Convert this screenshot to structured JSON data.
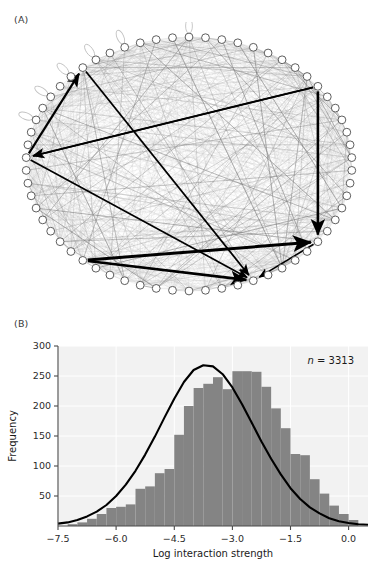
{
  "figure": {
    "panels": [
      {
        "id": "A",
        "label": "(A)",
        "type": "network-diagram"
      },
      {
        "id": "B",
        "label": "(B)",
        "type": "histogram"
      }
    ]
  },
  "panel_a": {
    "label": "(A)",
    "description": "Circular food-web interaction network",
    "node_count": 62,
    "node_fill": "#ffffff",
    "node_stroke": "#555555",
    "weak_link_color": "#b9b9b9",
    "strong_link_color": "#000000",
    "self_loop_count": 6,
    "strong_arrows": [
      {
        "from": 9,
        "to": 22,
        "width": 2.6
      },
      {
        "from": 9,
        "to": 47,
        "width": 1.9
      },
      {
        "from": 22,
        "to": 27,
        "width": 1.6
      },
      {
        "from": 38,
        "to": 22,
        "width": 3.0
      },
      {
        "from": 38,
        "to": 27,
        "width": 2.6
      },
      {
        "from": 47,
        "to": 55,
        "width": 2.2
      },
      {
        "from": 47,
        "to": 27,
        "width": 1.7
      },
      {
        "from": 55,
        "to": 27,
        "width": 1.8
      },
      {
        "from": 9,
        "to": 47,
        "width": 1.5
      }
    ]
  },
  "panel_b": {
    "label": "(B)",
    "annotation_n_italic": "n",
    "annotation_n_rest": " = 3313",
    "annotation_full": "n = 3313",
    "bar_color": "#848484",
    "curve_color": "#000000",
    "plot_bg": "#f2f2f2",
    "grid_color": "#ffffff"
  },
  "chart_data": {
    "type": "bar",
    "title": "",
    "subtitle": "",
    "xlabel": "Log interaction strength",
    "ylabel": "Frequency",
    "xlim": [
      -7.5,
      0.5
    ],
    "ylim": [
      0,
      300
    ],
    "xticks": [
      -7.5,
      -6.0,
      -4.5,
      -3.0,
      -1.5,
      0.0
    ],
    "xtick_labels": [
      "−7.5",
      "−6.0",
      "−4.5",
      "−3.0",
      "−1.5",
      "0.0"
    ],
    "yticks": [
      50,
      100,
      150,
      200,
      250,
      300
    ],
    "ytick_labels": [
      "50",
      "100",
      "150",
      "200",
      "250",
      "300"
    ],
    "grid": true,
    "legend": null,
    "n": 3313,
    "annotations": [
      {
        "text": "n = 3313",
        "x": -1.4,
        "y": 278,
        "italic_prefix": "n"
      }
    ],
    "bin_width": 0.25,
    "bin_edges": [
      -7.25,
      -7.0,
      -6.75,
      -6.5,
      -6.25,
      -6.0,
      -5.75,
      -5.5,
      -5.25,
      -5.0,
      -4.75,
      -4.5,
      -4.25,
      -4.0,
      -3.75,
      -3.5,
      -3.25,
      -3.0,
      -2.75,
      -2.5,
      -2.25,
      -2.0,
      -1.75,
      -1.5,
      -1.25,
      -1.0,
      -0.75,
      -0.5,
      -0.25,
      0.0,
      0.25
    ],
    "bin_centers": [
      -7.125,
      -6.875,
      -6.625,
      -6.375,
      -6.125,
      -5.875,
      -5.625,
      -5.375,
      -5.125,
      -4.875,
      -4.625,
      -4.375,
      -4.125,
      -3.875,
      -3.625,
      -3.375,
      -3.125,
      -2.875,
      -2.625,
      -2.375,
      -2.125,
      -1.875,
      -1.625,
      -1.375,
      -1.125,
      -0.875,
      -0.625,
      -0.375,
      -0.125,
      0.125
    ],
    "categories": [
      "-7.13",
      "-6.88",
      "-6.63",
      "-6.38",
      "-6.13",
      "-5.88",
      "-5.63",
      "-5.38",
      "-5.13",
      "-4.88",
      "-4.63",
      "-4.38",
      "-4.13",
      "-3.88",
      "-3.63",
      "-3.38",
      "-3.13",
      "-2.88",
      "-2.63",
      "-2.38",
      "-2.13",
      "-1.88",
      "-1.63",
      "-1.38",
      "-1.13",
      "-0.88",
      "-0.63",
      "-0.38",
      "-0.13",
      "0.13"
    ],
    "values": [
      3,
      6,
      12,
      20,
      30,
      32,
      36,
      62,
      66,
      88,
      95,
      152,
      200,
      230,
      237,
      248,
      228,
      258,
      258,
      257,
      232,
      196,
      163,
      120,
      118,
      78,
      54,
      34,
      20,
      10
    ],
    "series": [
      {
        "name": "Frequency",
        "type": "bar",
        "color": "#848484",
        "values": [
          3,
          6,
          12,
          20,
          30,
          32,
          36,
          62,
          66,
          88,
          95,
          152,
          200,
          230,
          237,
          248,
          228,
          258,
          258,
          257,
          232,
          196,
          163,
          120,
          118,
          78,
          54,
          34,
          20,
          10
        ]
      },
      {
        "name": "Fitted normal curve",
        "type": "line",
        "color": "#000000",
        "mean": -3.35,
        "sd": 1.32,
        "peak": 268,
        "x": [
          -7.5,
          -7.25,
          -7.0,
          -6.75,
          -6.5,
          -6.25,
          -6.0,
          -5.75,
          -5.5,
          -5.25,
          -5.0,
          -4.75,
          -4.5,
          -4.25,
          -4.0,
          -3.75,
          -3.5,
          -3.25,
          -3.0,
          -2.75,
          -2.5,
          -2.25,
          -2.0,
          -1.75,
          -1.5,
          -1.25,
          -1.0,
          -0.75,
          -0.5,
          -0.25,
          0.0,
          0.25,
          0.5
        ],
        "y": [
          4,
          6,
          10,
          16,
          24,
          35,
          50,
          69,
          92,
          119,
          149,
          181,
          212,
          240,
          260,
          268,
          266,
          253,
          231,
          203,
          172,
          141,
          112,
          86,
          63,
          45,
          31,
          21,
          13,
          8,
          5,
          3,
          2
        ]
      }
    ]
  }
}
